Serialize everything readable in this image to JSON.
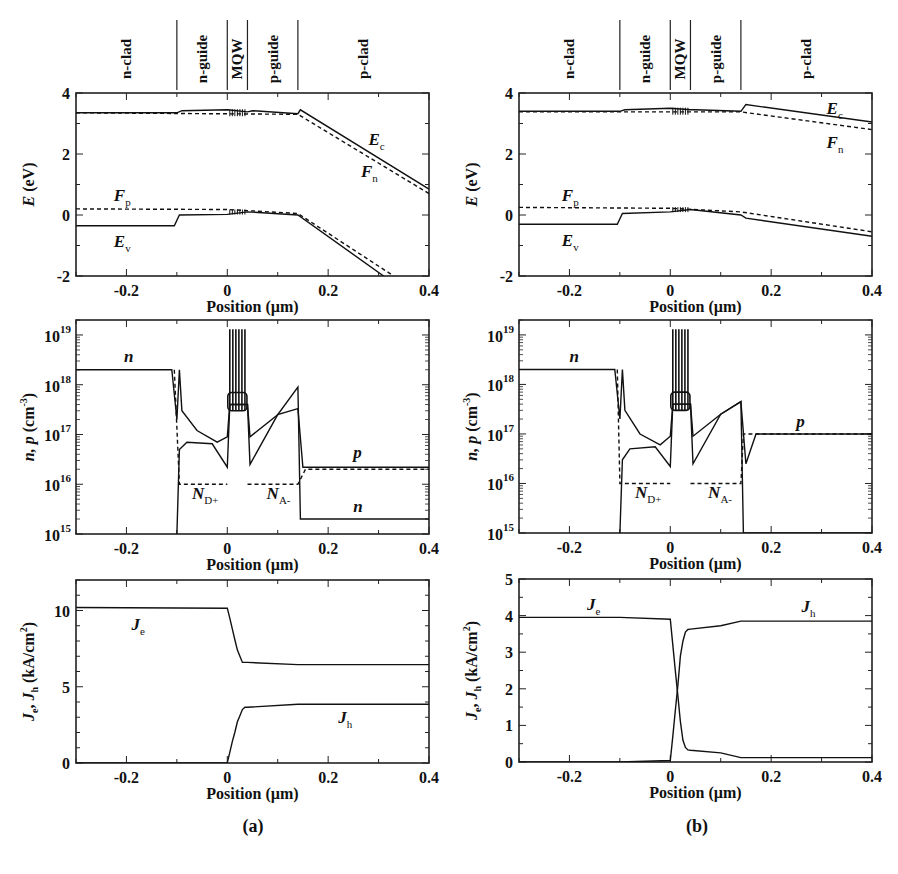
{
  "figure": {
    "panel_labels": [
      "(a)",
      "(b)"
    ],
    "x_axis_label": "Position (µm)",
    "regions": [
      "n-clad",
      "n-guide",
      "MQW",
      "p-guide",
      "p-clad"
    ],
    "region_boundaries_um": [
      -0.1,
      0.0,
      0.04,
      0.14
    ]
  },
  "chart_data": [
    {
      "id": "a-band",
      "panel": "(a)",
      "type": "line",
      "title": "",
      "xlabel": "Position (µm)",
      "ylabel": "E (eV)",
      "xlim": [
        -0.3,
        0.4
      ],
      "ylim": [
        -2,
        4
      ],
      "xticks": [
        -0.2,
        0,
        0.2,
        0.4
      ],
      "yticks": [
        -2,
        0,
        2,
        4
      ],
      "series": [
        {
          "name": "Ec",
          "style": "solid",
          "x": [
            -0.3,
            -0.1,
            -0.09,
            0.0,
            0.04,
            0.05,
            0.14,
            0.145,
            0.4
          ],
          "y": [
            3.35,
            3.35,
            3.42,
            3.45,
            3.38,
            3.42,
            3.32,
            3.45,
            0.85
          ]
        },
        {
          "name": "Fn",
          "style": "dashed",
          "x": [
            -0.3,
            0.14,
            0.4
          ],
          "y": [
            3.35,
            3.3,
            0.7
          ]
        },
        {
          "name": "Fp",
          "style": "dashed",
          "x": [
            -0.3,
            0.0,
            0.14,
            0.33
          ],
          "y": [
            0.2,
            0.18,
            0.05,
            -2.0
          ]
        },
        {
          "name": "Ev",
          "style": "solid",
          "x": [
            -0.3,
            -0.105,
            -0.095,
            0.0,
            0.04,
            0.14,
            0.31
          ],
          "y": [
            -0.35,
            -0.35,
            0.0,
            0.02,
            0.1,
            0.0,
            -2.0
          ]
        }
      ],
      "annotations": [
        {
          "text": "E",
          "sub": "c",
          "x": 0.28,
          "y": 2.3
        },
        {
          "text": "F",
          "sub": "n",
          "x": 0.265,
          "y": 1.25
        },
        {
          "text": "F",
          "sub": "p",
          "x": -0.225,
          "y": 0.45
        },
        {
          "text": "E",
          "sub": "v",
          "x": -0.225,
          "y": -1.05
        }
      ]
    },
    {
      "id": "a-carrier",
      "panel": "(a)",
      "type": "line",
      "xlabel": "Position (µm)",
      "ylabel": "n, p (cm-3)",
      "yscale": "log",
      "xlim": [
        -0.3,
        0.4
      ],
      "ylim": [
        1000000000000000.0,
        2e+19
      ],
      "xticks": [
        -0.2,
        0,
        0.2,
        0.4
      ],
      "ytick_labels": [
        "10^15",
        "10^16",
        "10^17",
        "10^18",
        "10^19"
      ],
      "series": [
        {
          "name": "n",
          "style": "solid",
          "x": [
            -0.3,
            -0.11,
            -0.1,
            -0.095,
            -0.09,
            -0.06,
            -0.02,
            0.0,
            0.005,
            0.04,
            0.045,
            0.1,
            0.14,
            0.145,
            0.4
          ],
          "y": [
            2e+18,
            2e+18,
            2e+17,
            2e+18,
            3e+17,
            1.2e+17,
            7e+16,
            9e+16,
            4e+17,
            4e+17,
            9e+16,
            2.5e+17,
            9e+17,
            2000000000000000.0,
            2000000000000000.0
          ]
        },
        {
          "name": "p",
          "style": "solid",
          "x": [
            -0.1,
            -0.095,
            -0.08,
            -0.03,
            0.0,
            0.005,
            0.04,
            0.045,
            0.1,
            0.14,
            0.15,
            0.4
          ],
          "y": [
            1000000000000000.0,
            5e+16,
            7e+16,
            6.5e+16,
            2.2e+16,
            4e+17,
            4e+17,
            2.5e+16,
            2.5e+17,
            3.3e+17,
            2.2e+16,
            2.2e+16
          ]
        },
        {
          "name": "ND+",
          "style": "dashed",
          "x": [
            -0.105,
            -0.095,
            0.0
          ],
          "y": [
            2e+18,
            1e+16,
            1e+16
          ]
        },
        {
          "name": "NA-",
          "style": "dashed",
          "x": [
            0.04,
            0.14,
            0.155,
            0.4
          ],
          "y": [
            1e+16,
            1e+16,
            2e+16,
            2e+16
          ]
        }
      ],
      "qw_spikes": {
        "x_start": 0.005,
        "x_end": 0.035,
        "count": 6,
        "peak": 1.3e+19,
        "base": 3e+17
      },
      "annotations": [
        {
          "text": "n",
          "x": -0.205,
          "y": 2.8e+18
        },
        {
          "text": "p",
          "x": 0.25,
          "y": 3.3e+16
        },
        {
          "text": "n",
          "x": 0.25,
          "y": 2800000000000000.0
        },
        {
          "text": "N",
          "sub": "D+",
          "x": -0.07,
          "y": 5000000000000000.0
        },
        {
          "text": "N",
          "sub": "A-",
          "x": 0.078,
          "y": 5000000000000000.0
        }
      ]
    },
    {
      "id": "a-current",
      "panel": "(a)",
      "type": "line",
      "xlabel": "Position (µm)",
      "ylabel": "Je, Jh (kA/cm2)",
      "xlim": [
        -0.3,
        0.4
      ],
      "ylim": [
        0,
        12
      ],
      "xticks": [
        -0.2,
        0,
        0.2,
        0.4
      ],
      "yticks": [
        0,
        5,
        10
      ],
      "series": [
        {
          "name": "Je",
          "style": "solid",
          "x": [
            -0.3,
            0.0,
            0.005,
            0.01,
            0.015,
            0.02,
            0.025,
            0.03,
            0.035,
            0.04,
            0.14,
            0.4
          ],
          "y": [
            10.2,
            10.15,
            9.5,
            8.8,
            8.1,
            7.4,
            7.0,
            6.6,
            6.6,
            6.6,
            6.45,
            6.45
          ]
        },
        {
          "name": "Jh",
          "style": "solid",
          "x": [
            -0.3,
            0.0,
            0.005,
            0.01,
            0.015,
            0.02,
            0.025,
            0.03,
            0.035,
            0.04,
            0.14,
            0.4
          ],
          "y": [
            0,
            0.02,
            0.7,
            1.4,
            2.0,
            2.7,
            3.1,
            3.5,
            3.65,
            3.65,
            3.85,
            3.85
          ]
        }
      ],
      "annotations": [
        {
          "text": "J",
          "sub": "e",
          "x": -0.19,
          "y": 8.7
        },
        {
          "text": "J",
          "sub": "h",
          "x": 0.22,
          "y": 2.6
        }
      ]
    },
    {
      "id": "b-band",
      "panel": "(b)",
      "type": "line",
      "xlabel": "Position (µm)",
      "ylabel": "E (eV)",
      "xlim": [
        -0.3,
        0.4
      ],
      "ylim": [
        -2,
        4
      ],
      "xticks": [
        -0.2,
        0,
        0.2,
        0.4
      ],
      "yticks": [
        -2,
        0,
        2,
        4
      ],
      "series": [
        {
          "name": "Ec",
          "style": "solid",
          "x": [
            -0.3,
            -0.1,
            -0.09,
            0.0,
            0.04,
            0.05,
            0.14,
            0.15,
            0.4
          ],
          "y": [
            3.4,
            3.4,
            3.45,
            3.5,
            3.45,
            3.45,
            3.4,
            3.62,
            3.05
          ]
        },
        {
          "name": "Fn",
          "style": "dashed",
          "x": [
            -0.3,
            0.14,
            0.4
          ],
          "y": [
            3.38,
            3.38,
            2.8
          ]
        },
        {
          "name": "Fp",
          "style": "dashed",
          "x": [
            -0.3,
            0.0,
            0.14,
            0.4
          ],
          "y": [
            0.25,
            0.22,
            0.1,
            -0.55
          ]
        },
        {
          "name": "Ev",
          "style": "solid",
          "x": [
            -0.3,
            -0.105,
            -0.095,
            0.0,
            0.04,
            0.14,
            0.15,
            0.4
          ],
          "y": [
            -0.3,
            -0.3,
            0.05,
            0.1,
            0.18,
            0.0,
            -0.1,
            -0.7
          ]
        }
      ],
      "annotations": [
        {
          "text": "E",
          "sub": "c",
          "x": 0.31,
          "y": 3.3
        },
        {
          "text": "F",
          "sub": "n",
          "x": 0.31,
          "y": 2.2
        },
        {
          "text": "F",
          "sub": "p",
          "x": -0.215,
          "y": 0.45
        },
        {
          "text": "E",
          "sub": "v",
          "x": -0.215,
          "y": -1.0
        }
      ]
    },
    {
      "id": "b-carrier",
      "panel": "(b)",
      "type": "line",
      "xlabel": "Position (µm)",
      "ylabel": "n, p (cm-3)",
      "yscale": "log",
      "xlim": [
        -0.3,
        0.4
      ],
      "ylim": [
        1000000000000000.0,
        2e+19
      ],
      "xticks": [
        -0.2,
        0,
        0.2,
        0.4
      ],
      "ytick_labels": [
        "10^15",
        "10^16",
        "10^17",
        "10^18",
        "10^19"
      ],
      "series": [
        {
          "name": "n",
          "style": "solid",
          "x": [
            -0.3,
            -0.11,
            -0.1,
            -0.095,
            -0.09,
            -0.06,
            -0.02,
            0.0,
            0.005,
            0.04,
            0.045,
            0.1,
            0.14,
            0.145,
            0.4
          ],
          "y": [
            2e+18,
            2e+18,
            2e+17,
            2e+18,
            3e+17,
            1e+17,
            6e+16,
            9e+16,
            4e+17,
            4e+17,
            9e+16,
            2.5e+17,
            4.5e+17,
            1000000000000000.0,
            1000000000000000.0
          ]
        },
        {
          "name": "p",
          "style": "solid",
          "x": [
            -0.1,
            -0.095,
            -0.08,
            -0.03,
            0.0,
            0.005,
            0.04,
            0.045,
            0.1,
            0.14,
            0.15,
            0.17,
            0.4
          ],
          "y": [
            1000000000000000.0,
            3e+16,
            5e+16,
            5.5e+16,
            2.2e+16,
            4e+17,
            4e+17,
            2.5e+16,
            2.5e+17,
            4.5e+17,
            2.5e+16,
            1e+17,
            1e+17
          ]
        },
        {
          "name": "ND+",
          "style": "dashed",
          "x": [
            -0.105,
            -0.1,
            0.0
          ],
          "y": [
            2e+18,
            1e+16,
            1e+16
          ]
        },
        {
          "name": "NA-",
          "style": "dashed",
          "x": [
            0.04,
            0.14,
            0.145,
            0.4
          ],
          "y": [
            1e+16,
            1e+16,
            1e+17,
            1e+17
          ]
        }
      ],
      "qw_spikes": {
        "x_start": 0.005,
        "x_end": 0.035,
        "count": 6,
        "peak": 1.3e+19,
        "base": 3e+17
      },
      "annotations": [
        {
          "text": "n",
          "x": -0.2,
          "y": 2.8e+18
        },
        {
          "text": "p",
          "x": 0.25,
          "y": 1.4e+17
        },
        {
          "text": "N",
          "sub": "D+",
          "x": -0.07,
          "y": 5000000000000000.0
        },
        {
          "text": "N",
          "sub": "A-",
          "x": 0.075,
          "y": 5000000000000000.0
        }
      ]
    },
    {
      "id": "b-current",
      "panel": "(b)",
      "type": "line",
      "xlabel": "Position (µm)",
      "ylabel": "Je, Jh (kA/cm2)",
      "xlim": [
        -0.3,
        0.4
      ],
      "ylim": [
        0,
        5
      ],
      "xticks": [
        -0.2,
        0,
        0.2,
        0.4
      ],
      "yticks": [
        0,
        1,
        2,
        3,
        4,
        5
      ],
      "series": [
        {
          "name": "Je",
          "style": "solid",
          "x": [
            -0.3,
            -0.1,
            0.0,
            0.005,
            0.01,
            0.015,
            0.02,
            0.025,
            0.03,
            0.035,
            0.04,
            0.1,
            0.14,
            0.4
          ],
          "y": [
            3.95,
            3.95,
            3.9,
            3.2,
            2.5,
            1.8,
            1.1,
            0.6,
            0.4,
            0.33,
            0.32,
            0.25,
            0.12,
            0.12
          ]
        },
        {
          "name": "Jh",
          "style": "solid",
          "x": [
            -0.3,
            -0.1,
            0.0,
            0.005,
            0.01,
            0.015,
            0.02,
            0.025,
            0.03,
            0.035,
            0.04,
            0.1,
            0.14,
            0.4
          ],
          "y": [
            0,
            0,
            0.04,
            0.7,
            1.4,
            2.1,
            2.9,
            3.3,
            3.55,
            3.62,
            3.63,
            3.72,
            3.85,
            3.85
          ]
        }
      ],
      "annotations": [
        {
          "text": "J",
          "sub": "e",
          "x": -0.165,
          "y": 4.15
        },
        {
          "text": "J",
          "sub": "h",
          "x": 0.26,
          "y": 4.1
        }
      ]
    }
  ]
}
